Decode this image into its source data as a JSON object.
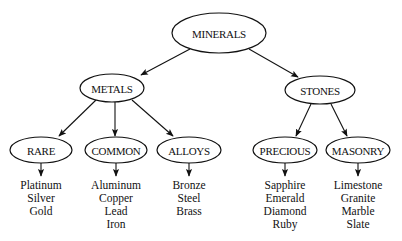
{
  "diagram": {
    "type": "tree",
    "root": {
      "id": "minerals",
      "label": "MINERALS",
      "cx": 219,
      "cy": 33,
      "rx": 47,
      "ry": 20
    },
    "level1": [
      {
        "id": "metals",
        "label": "METALS",
        "cx": 112,
        "cy": 88,
        "rx": 32,
        "ry": 14
      },
      {
        "id": "stones",
        "label": "STONES",
        "cx": 320,
        "cy": 90,
        "rx": 35,
        "ry": 14
      }
    ],
    "level2": [
      {
        "id": "rare",
        "label": "RARE",
        "parent": "metals",
        "cx": 41,
        "cy": 150,
        "rx": 31,
        "ry": 13,
        "items": [
          "Platinum",
          "Silver",
          "Gold"
        ]
      },
      {
        "id": "common",
        "label": "COMMON",
        "parent": "metals",
        "cx": 116,
        "cy": 150,
        "rx": 31,
        "ry": 13,
        "items": [
          "Aluminum",
          "Copper",
          "Lead",
          "Iron"
        ]
      },
      {
        "id": "alloys",
        "label": "ALLOYS",
        "parent": "metals",
        "cx": 189,
        "cy": 150,
        "rx": 32,
        "ry": 13,
        "items": [
          "Bronze",
          "Steel",
          "Brass"
        ]
      },
      {
        "id": "precious",
        "label": "PRECIOUS",
        "parent": "stones",
        "cx": 285,
        "cy": 150,
        "rx": 32,
        "ry": 13,
        "items": [
          "Sapphire",
          "Emerald",
          "Diamond",
          "Ruby"
        ]
      },
      {
        "id": "masonry",
        "label": "MASONRY",
        "parent": "stones",
        "cx": 358,
        "cy": 150,
        "rx": 32,
        "ry": 13,
        "items": [
          "Limestone",
          "Granite",
          "Marble",
          "Slate"
        ]
      }
    ],
    "colors": {
      "stroke": "#111111",
      "fill": "#ffffff",
      "background": "#ffffff"
    }
  }
}
